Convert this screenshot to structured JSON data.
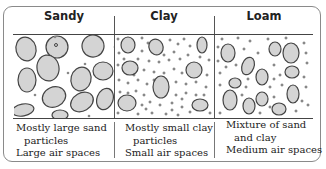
{
  "columns": [
    {
      "title": "Sandy",
      "caption": [
        "Mostly large sand",
        "particles",
        "Large air spaces"
      ]
    },
    {
      "title": "Clay",
      "caption": [
        "Mostly small clay",
        "particles",
        "Small air spaces"
      ]
    },
    {
      "title": "Loam",
      "caption": [
        "Mixture of sand",
        "and clay",
        "Medium air spaces"
      ]
    }
  ],
  "colors": {
    "particle_fill": "#d4d4d4",
    "particle_stroke": "#444444",
    "border": "#8a8a8a"
  }
}
